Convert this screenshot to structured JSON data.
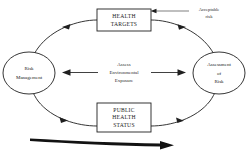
{
  "diagram": {
    "nodes": {
      "top_box": {
        "name": "health-targets",
        "lines": [
          "HEALTH",
          "TARGETS"
        ]
      },
      "bottom_box": {
        "name": "public-health-status",
        "lines": [
          "PUBLIC",
          "HEALTH",
          "STATUS"
        ]
      },
      "left_ellipse": {
        "name": "risk-management",
        "lines": [
          "Risk",
          "Management"
        ]
      },
      "right_ellipse": {
        "name": "assessment-of-risk",
        "lines": [
          "Assessment",
          "of",
          "Risk"
        ]
      }
    },
    "labels": {
      "center": [
        "Assess",
        "Environmental",
        "Exposure"
      ],
      "annotation": [
        "Acceptable",
        "risk"
      ]
    },
    "colors": {
      "stroke": "#1f1f1f",
      "text": "#1a1a1a",
      "background": "#ffffff",
      "thick_arrow": "#121212"
    }
  }
}
